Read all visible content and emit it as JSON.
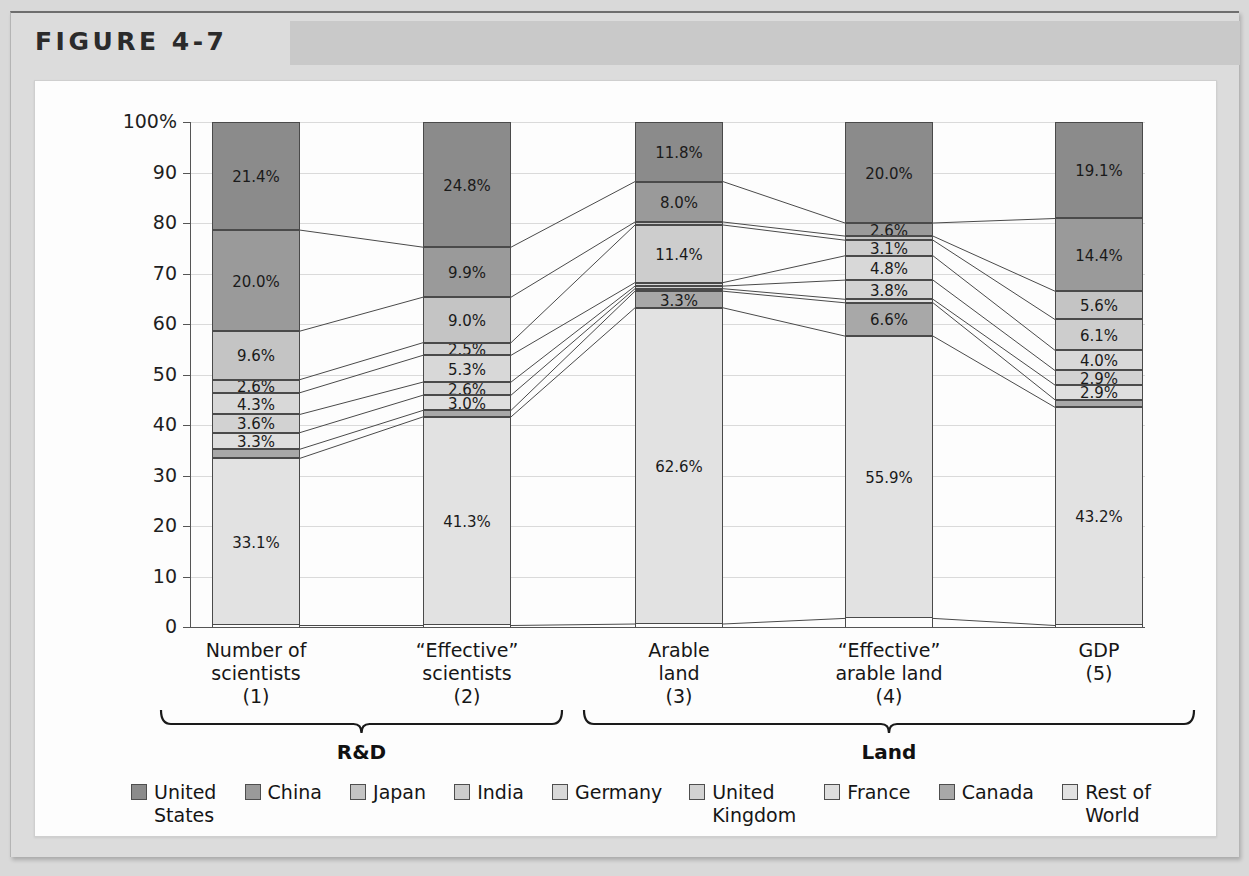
{
  "figure": {
    "label": "FIGURE 4-7"
  },
  "chart_data": {
    "type": "bar",
    "subtype": "stacked-100-percent",
    "title": "FIGURE 4-7",
    "xlabel": "",
    "ylabel": "",
    "ylim": [
      0,
      100
    ],
    "grid": true,
    "legend_position": "bottom",
    "ytick_labels": [
      "100%",
      "90",
      "80",
      "70",
      "60",
      "50",
      "40",
      "30",
      "20",
      "10",
      "0"
    ],
    "ytick_values": [
      100,
      90,
      80,
      70,
      60,
      50,
      40,
      30,
      20,
      10,
      0
    ],
    "categories": [
      "Number of scientists (1)",
      "“Effective” scientists (2)",
      "Arable land (3)",
      "“Effective” arable land (4)",
      "GDP (5)"
    ],
    "category_lines": [
      [
        "Number of",
        "scientists",
        "(1)"
      ],
      [
        "“Effective”",
        "scientists",
        "(2)"
      ],
      [
        "Arable",
        "land",
        "(3)"
      ],
      [
        "“Effective”",
        "arable land",
        "(4)"
      ],
      [
        "GDP",
        "(5)"
      ]
    ],
    "groups": [
      {
        "label": "R&D",
        "categories": [
          0,
          1
        ]
      },
      {
        "label": "Land",
        "categories": [
          2,
          3,
          4
        ]
      }
    ],
    "legend_entries": [
      {
        "label": "United States",
        "lines": [
          "United",
          "States"
        ],
        "color": "#8b8b8b"
      },
      {
        "label": "China",
        "lines": [
          "China"
        ],
        "color": "#9a9a9a"
      },
      {
        "label": "Japan",
        "lines": [
          "Japan"
        ],
        "color": "#c4c4c4"
      },
      {
        "label": "India",
        "lines": [
          "India"
        ],
        "color": "#cdcdcd"
      },
      {
        "label": "Germany",
        "lines": [
          "Germany"
        ],
        "color": "#d8d8d8"
      },
      {
        "label": "United Kingdom",
        "lines": [
          "United",
          "Kingdom"
        ],
        "color": "#d2d2d2"
      },
      {
        "label": "France",
        "lines": [
          "France"
        ],
        "color": "#dedede"
      },
      {
        "label": "Canada",
        "lines": [
          "Canada"
        ],
        "color": "#a8a8a8"
      },
      {
        "label": "Rest of World",
        "lines": [
          "Rest of",
          "World"
        ],
        "color": "#e2e2e2"
      }
    ],
    "series": [
      {
        "name": "United States",
        "color": "#8b8b8b",
        "values": [
          21.4,
          24.8,
          11.8,
          20.0,
          19.1
        ],
        "labels": [
          "21.4%",
          "24.8%",
          "11.8%",
          "20.0%",
          "19.1%"
        ]
      },
      {
        "name": "China",
        "color": "#9a9a9a",
        "values": [
          20.0,
          9.9,
          8.0,
          2.6,
          14.4
        ],
        "labels": [
          "20.0%",
          "9.9%",
          "8.0%",
          "2.6%",
          "14.4%"
        ]
      },
      {
        "name": "Japan",
        "color": "#c4c4c4",
        "values": [
          9.6,
          9.0,
          0.6,
          0.8,
          5.6
        ],
        "labels": [
          "9.6%",
          "9.0%",
          "",
          "",
          "5.6%"
        ]
      },
      {
        "name": "India",
        "color": "#cdcdcd",
        "values": [
          2.6,
          2.5,
          11.4,
          3.1,
          6.1
        ],
        "labels": [
          "2.6%",
          "2.5%",
          "11.4%",
          "3.1%",
          "6.1%"
        ]
      },
      {
        "name": "Germany",
        "color": "#d8d8d8",
        "values": [
          4.3,
          5.3,
          0.7,
          4.8,
          4.0
        ],
        "labels": [
          "4.3%",
          "5.3%",
          "",
          "4.8%",
          "4.0%"
        ]
      },
      {
        "name": "United Kingdom",
        "color": "#d2d2d2",
        "values": [
          3.6,
          2.6,
          0.5,
          3.8,
          2.9
        ],
        "labels": [
          "3.6%",
          "2.6%",
          "",
          "3.8%",
          "2.9%"
        ]
      },
      {
        "name": "France",
        "color": "#dedede",
        "values": [
          3.3,
          3.0,
          0.5,
          0.7,
          2.9
        ],
        "labels": [
          "3.3%",
          "3.0%",
          "",
          "",
          "2.9%"
        ]
      },
      {
        "name": "Canada",
        "color": "#a8a8a8",
        "values": [
          1.8,
          1.3,
          3.3,
          6.6,
          1.5
        ],
        "labels": [
          "",
          "",
          "3.3%",
          "6.6%",
          ""
        ]
      },
      {
        "name": "Rest of World",
        "color": "#e2e2e2",
        "values": [
          33.1,
          41.3,
          62.6,
          55.9,
          43.2
        ],
        "labels": [
          "33.1%",
          "41.3%",
          "62.6%",
          "55.9%",
          "43.2%"
        ]
      }
    ]
  }
}
